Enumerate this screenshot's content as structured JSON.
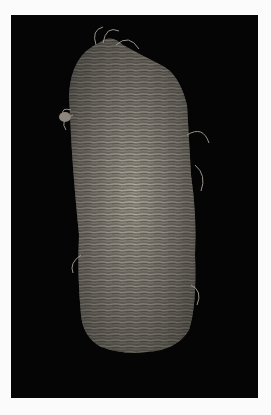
{
  "image": {
    "subject": "woven plant-fiber sandal",
    "background": "black",
    "frame_color": "#fbfbfb",
    "background_color": "#050505",
    "fiber_color": "#9a948a"
  }
}
